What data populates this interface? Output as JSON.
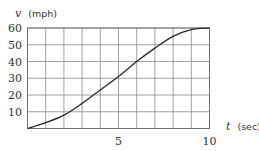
{
  "chart_data": {
    "type": "line",
    "title": "",
    "xlabel": "t (sec)",
    "ylabel": "v (mph)",
    "xlabel_var": "t",
    "xlabel_unit": "(sec)",
    "ylabel_var": "v",
    "ylabel_unit": "(mph)",
    "xlim": [
      0,
      10
    ],
    "ylim": [
      0,
      60
    ],
    "x_ticks": [
      5,
      10
    ],
    "x_tick_labels": [
      "5",
      "10"
    ],
    "y_ticks": [
      10,
      20,
      30,
      40,
      50,
      60
    ],
    "y_tick_labels": [
      "10",
      "20",
      "30",
      "40",
      "50",
      "60"
    ],
    "grid": true,
    "grid_x_step": 1,
    "grid_y_step": 10,
    "legend": null,
    "series": [
      {
        "name": "velocity",
        "x": [
          0,
          1,
          2,
          3,
          4,
          5,
          6,
          7,
          8,
          9,
          10
        ],
        "values": [
          0,
          3.5,
          8,
          15,
          23,
          31,
          40,
          48,
          55,
          59,
          60
        ]
      }
    ]
  }
}
